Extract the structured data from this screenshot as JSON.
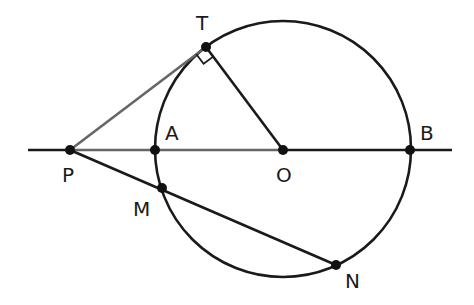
{
  "diagram": {
    "circle": {
      "center": "O",
      "cx": 283,
      "cy": 149,
      "r": 128
    },
    "points": {
      "T": {
        "x": 206,
        "y": 47,
        "label": "T",
        "lx": 196,
        "ly": 30
      },
      "P": {
        "x": 70,
        "y": 150,
        "label": "P",
        "lx": 62,
        "ly": 182
      },
      "A": {
        "x": 155,
        "y": 150,
        "label": "A",
        "lx": 165,
        "ly": 140
      },
      "O": {
        "x": 283,
        "y": 150,
        "label": "O",
        "lx": 276,
        "ly": 182
      },
      "B": {
        "x": 410,
        "y": 150,
        "label": "B",
        "lx": 420,
        "ly": 140
      },
      "M": {
        "x": 162,
        "y": 188,
        "label": "M",
        "lx": 133,
        "ly": 216
      },
      "N": {
        "x": 336,
        "y": 265,
        "label": "N",
        "lx": 345,
        "ly": 288
      }
    },
    "segments": [
      {
        "from": "P",
        "to": "T",
        "name": "tangent-PT"
      },
      {
        "from": "T",
        "to": "O",
        "name": "radius-OT"
      },
      {
        "from": "P",
        "to": "N",
        "name": "secant-PMN"
      },
      {
        "from": "P",
        "to": "O",
        "name": "line-PA-AO"
      }
    ],
    "line_extent": {
      "x1": 28,
      "x2": 452,
      "y": 150
    },
    "right_angle_at": "T",
    "colors": {
      "stroke": "#1a1a1a",
      "secondary": "#666666",
      "background": "#ffffff"
    }
  }
}
